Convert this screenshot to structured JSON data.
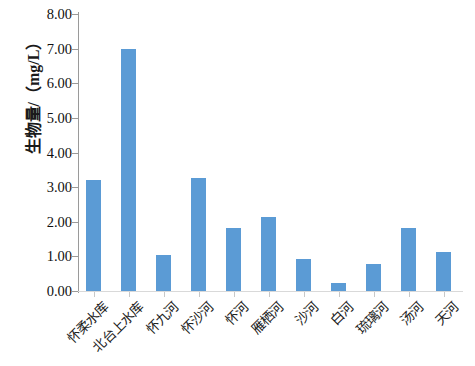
{
  "chart_data": {
    "type": "bar",
    "title": "",
    "xlabel": "",
    "ylabel": "生物量/（mg/L）",
    "ylim": [
      0,
      8
    ],
    "ytick_interval": 1,
    "ytick_labels": [
      "8.00",
      "7.00",
      "6.00",
      "5.00",
      "4.00",
      "3.00",
      "2.00",
      "1.00",
      "0.00"
    ],
    "ytick_values": [
      8,
      7,
      6,
      5,
      4,
      3,
      2,
      1,
      0
    ],
    "grid": false,
    "legend": null,
    "bar_color": "#5b9bd5",
    "axis_color": "#9a9a9a",
    "categories": [
      "怀柔水库",
      "北台上水库",
      "怀九河",
      "怀沙河",
      "怀河",
      "雁栖河",
      "沙河",
      "白河",
      "琉璃河",
      "汤河",
      "天河"
    ],
    "values": [
      3.2,
      7.0,
      1.05,
      3.26,
      1.82,
      2.14,
      0.93,
      0.24,
      0.78,
      1.83,
      1.12
    ]
  }
}
